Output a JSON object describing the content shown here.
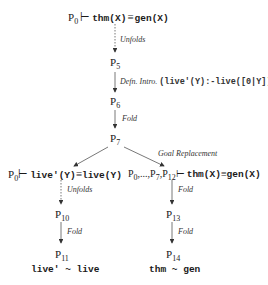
{
  "nodes": {
    "root": {
      "p": "P",
      "sub": "0",
      "turnstile": "⊢",
      "lhs": "thm(X)",
      "equiv": "≡",
      "rhs": "gen(X)"
    },
    "p5": {
      "p": "P",
      "sub": "5"
    },
    "p6": {
      "p": "P",
      "sub": "6"
    },
    "p7": {
      "p": "P",
      "sub": "7"
    },
    "left_goal": {
      "p": "P",
      "sub": "0",
      "turnstile": "⊢",
      "lhs": "live'(Y)",
      "equiv": "≡",
      "rhs": "live(Y)"
    },
    "right_goal": {
      "prefix": "P",
      "sub0": "0",
      "dots": ",...,P",
      "sub7": "7",
      "comma": ",P",
      "sub12": "12",
      "turnstile": "⊢",
      "lhs": "thm(X)",
      "equiv": "≡",
      "rhs": "gen(X)"
    },
    "p10": {
      "p": "P",
      "sub": "10"
    },
    "p11": {
      "p": "P",
      "sub": "11"
    },
    "p13": {
      "p": "P",
      "sub": "13"
    },
    "p14": {
      "p": "P",
      "sub": "14"
    }
  },
  "edges": {
    "root_p5": {
      "label": "Unfolds",
      "style": "dotted"
    },
    "p5_p6": {
      "label": "Defn. Intro.",
      "code": "(live'(Y):-live([0|Y]))."
    },
    "p6_p7": {
      "label": "Fold",
      "style": "solid"
    },
    "p7_left": {
      "label": ""
    },
    "p7_right": {
      "label": "Goal Replacement"
    },
    "left_p10": {
      "label": "Unfolds",
      "style": "dotted"
    },
    "p10_p11": {
      "label": "Fold",
      "style": "solid"
    },
    "right_p13": {
      "label": "Fold",
      "style": "solid"
    },
    "p13_p14": {
      "label": "Fold",
      "style": "solid"
    }
  },
  "results": {
    "left": "live' ~ live",
    "right": "thm ~ gen"
  }
}
